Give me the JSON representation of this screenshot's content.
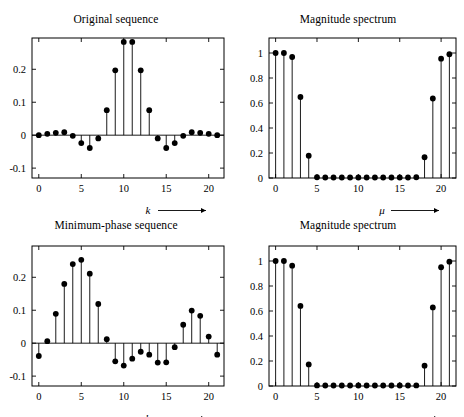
{
  "figure": {
    "background": "#ffffff",
    "foreground": "#000000",
    "layout": "2x2 grid of stem (discrete sequence) plots"
  },
  "panels": [
    {
      "id": "top-left",
      "title": "Original sequence",
      "xlabel": "k",
      "xlabel_arrow": true,
      "ylabel": ""
    },
    {
      "id": "top-right",
      "title": "Magnitude spectrum",
      "xlabel": "μ",
      "xlabel_arrow": true,
      "ylabel": ""
    },
    {
      "id": "bottom-left",
      "title": "Minimum-phase sequence",
      "xlabel": "k",
      "xlabel_arrow": true,
      "ylabel": ""
    },
    {
      "id": "bottom-right",
      "title": "Magnitude spectrum",
      "xlabel": "μ",
      "xlabel_arrow": true,
      "ylabel": ""
    }
  ],
  "chart_data": [
    {
      "type": "line",
      "subtype": "stem",
      "panel": "top-left",
      "title": "Original sequence",
      "xlabel": "k",
      "ylabel": "",
      "xlim": [
        -0.8,
        21.8
      ],
      "ylim": [
        -0.13,
        0.295
      ],
      "xticks": [
        0,
        5,
        10,
        15,
        20
      ],
      "xticklabels": [
        "0",
        "5",
        "10",
        "15",
        "20"
      ],
      "yticks": [
        -0.1,
        0,
        0.1,
        0.2
      ],
      "yticklabels": [
        "-0.1",
        "0",
        "0.1",
        "0.2"
      ],
      "grid": false,
      "legend": null,
      "marker": "filled-circle",
      "x": [
        0,
        1,
        2,
        3,
        4,
        5,
        6,
        7,
        8,
        9,
        10,
        11,
        12,
        13,
        14,
        15,
        16,
        17,
        18,
        19,
        20,
        21
      ],
      "values": [
        0.0,
        0.004,
        0.007,
        0.009,
        -0.002,
        -0.024,
        -0.039,
        -0.01,
        0.076,
        0.197,
        0.283,
        0.283,
        0.197,
        0.076,
        -0.01,
        -0.039,
        -0.024,
        -0.002,
        0.009,
        0.007,
        0.004,
        0.0
      ]
    },
    {
      "type": "line",
      "subtype": "stem",
      "panel": "top-right",
      "title": "Magnitude spectrum",
      "xlabel": "μ",
      "ylabel": "",
      "xlim": [
        -0.8,
        21.8
      ],
      "ylim": [
        0,
        1.12
      ],
      "xticks": [
        0,
        5,
        10,
        15,
        20
      ],
      "xticklabels": [
        "0",
        "5",
        "10",
        "15",
        "20"
      ],
      "yticks": [
        0,
        0.2,
        0.4,
        0.6,
        0.8,
        1.0
      ],
      "yticklabels": [
        "0",
        "0.2",
        "0.4",
        "0.6",
        "0.8",
        "1"
      ],
      "grid": false,
      "legend": null,
      "marker": "filled-circle",
      "x": [
        0,
        1,
        2,
        3,
        4,
        5,
        6,
        7,
        8,
        9,
        10,
        11,
        12,
        13,
        14,
        15,
        16,
        17,
        18,
        19,
        20,
        21
      ],
      "values": [
        1.0,
        1.0,
        0.968,
        0.648,
        0.178,
        0.006,
        0.004,
        0.004,
        0.004,
        0.004,
        0.004,
        0.004,
        0.004,
        0.004,
        0.004,
        0.004,
        0.004,
        0.006,
        0.166,
        0.636,
        0.955,
        0.99
      ]
    },
    {
      "type": "line",
      "subtype": "stem",
      "panel": "bottom-left",
      "title": "Minimum-phase sequence",
      "xlabel": "k",
      "ylabel": "",
      "xlim": [
        -0.8,
        21.8
      ],
      "ylim": [
        -0.13,
        0.295
      ],
      "xticks": [
        0,
        5,
        10,
        15,
        20
      ],
      "xticklabels": [
        "0",
        "5",
        "10",
        "15",
        "20"
      ],
      "yticks": [
        -0.1,
        0,
        0.1,
        0.2
      ],
      "yticklabels": [
        "-0.1",
        "0",
        "0.1",
        "0.2"
      ],
      "grid": false,
      "legend": null,
      "marker": "filled-circle",
      "x": [
        0,
        1,
        2,
        3,
        4,
        5,
        6,
        7,
        8,
        9,
        10,
        11,
        12,
        13,
        14,
        15,
        16,
        17,
        18,
        19,
        20,
        21
      ],
      "values": [
        -0.039,
        0.006,
        0.089,
        0.18,
        0.24,
        0.253,
        0.211,
        0.119,
        0.012,
        -0.055,
        -0.068,
        -0.047,
        -0.026,
        -0.035,
        -0.059,
        -0.058,
        -0.012,
        0.056,
        0.099,
        0.083,
        0.02,
        -0.035
      ]
    },
    {
      "type": "line",
      "subtype": "stem",
      "panel": "bottom-right",
      "title": "Magnitude spectrum",
      "xlabel": "μ",
      "ylabel": "",
      "xlim": [
        -0.8,
        21.8
      ],
      "ylim": [
        0,
        1.12
      ],
      "xticks": [
        0,
        5,
        10,
        15,
        20
      ],
      "xticklabels": [
        "0",
        "5",
        "10",
        "15",
        "20"
      ],
      "yticks": [
        0,
        0.2,
        0.4,
        0.6,
        0.8,
        1.0
      ],
      "yticklabels": [
        "0",
        "0.2",
        "0.4",
        "0.6",
        "0.8",
        "1"
      ],
      "grid": false,
      "legend": null,
      "marker": "filled-circle",
      "x": [
        0,
        1,
        2,
        3,
        4,
        5,
        6,
        7,
        8,
        9,
        10,
        11,
        12,
        13,
        14,
        15,
        16,
        17,
        18,
        19,
        20,
        21
      ],
      "values": [
        1.0,
        1.0,
        0.963,
        0.641,
        0.173,
        0.005,
        0.004,
        0.004,
        0.004,
        0.004,
        0.004,
        0.004,
        0.004,
        0.004,
        0.004,
        0.004,
        0.004,
        0.005,
        0.163,
        0.629,
        0.95,
        0.995
      ]
    }
  ]
}
